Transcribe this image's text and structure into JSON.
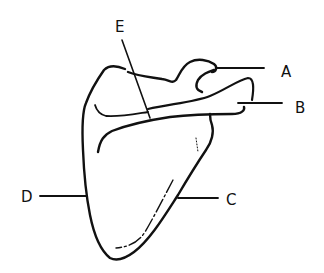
{
  "diagram": {
    "stroke_color": "#111111",
    "background": "#ffffff",
    "labels": [
      {
        "id": "A",
        "text": "A"
      },
      {
        "id": "B",
        "text": "B"
      },
      {
        "id": "C",
        "text": "C"
      },
      {
        "id": "D",
        "text": "D"
      },
      {
        "id": "E",
        "text": "E"
      }
    ]
  }
}
